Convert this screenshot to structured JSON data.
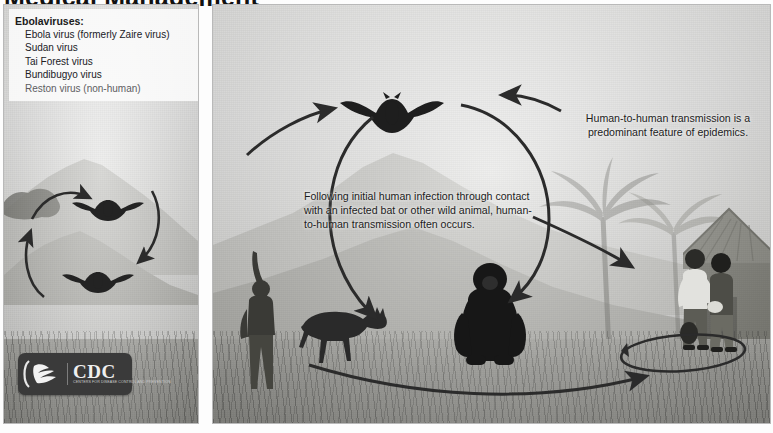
{
  "document": {
    "title_partial": "Medical Management"
  },
  "legend": {
    "title": "Ebolaviruses:",
    "items": [
      "Ebola virus (formerly Zaire virus)",
      "Sudan virus",
      "Tai Forest virus",
      "Bundibugyo virus",
      "Reston virus (non-human)"
    ]
  },
  "logo": {
    "name": "CDC",
    "tagline": "CENTERS FOR DISEASE CONTROL AND PREVENTION",
    "mark_name": "hhs-department-mark"
  },
  "captions": {
    "center": "Following initial human infection through contact with an infected bat or other wild animal, human-to-human transmission often occurs.",
    "right": "Human-to-human transmission is a predominant feature of epidemics."
  },
  "figures": {
    "bat_left_upper": "fruit-bat-silhouette",
    "bat_left_lower": "fruit-bat-silhouette",
    "bat_main": "fruit-bat-silhouette",
    "duiker": "antelope-duiker-silhouette",
    "gorilla": "gorilla-silhouette",
    "hunter": "hunter-with-raised-arm-silhouette",
    "villagers": "two-villagers-silhouette",
    "hut": "thatched-hut",
    "palms": "palm-trees"
  },
  "arrows": {
    "left_cycle_upper": "curved-arrow-bat-to-bat",
    "left_cycle_lower": "curved-arrow-bat-to-bat",
    "transmission_loop": "large-circular-transmission-arrow",
    "to_village_upper": "arrow-to-village",
    "to_village_lower": "arrow-to-village",
    "village_loop": "human-to-human-loop-arrow"
  },
  "colors": {
    "silhouette": "#232323",
    "arrow": "#2b2b2b",
    "panel_border": "#b9b9b9",
    "logo_background": "#3a3a3a",
    "text": "#1c1c1c"
  }
}
